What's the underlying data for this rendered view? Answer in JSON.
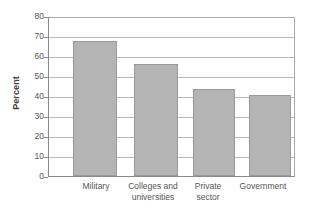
{
  "chart_data": {
    "type": "bar",
    "title": "",
    "subtitle": "",
    "xlabel": "",
    "ylabel": "Percent",
    "categories": [
      "Military",
      "Colleges and universities",
      "Private sector",
      "Government"
    ],
    "values": [
      68.5,
      56.5,
      44,
      41
    ],
    "ylim": [
      0,
      80
    ],
    "ytick_step": 10,
    "yticks": [
      80,
      70,
      60,
      50,
      40,
      30,
      20,
      10,
      0
    ],
    "ytick_labels": [
      "80",
      "70",
      "60",
      "50",
      "40",
      "30",
      "20",
      "10",
      "0"
    ],
    "grid": "horizontal",
    "legend": "none",
    "series": [
      {
        "name": "Percent",
        "values": [
          68.5,
          56.5,
          44,
          41
        ],
        "color": "#b4b4b4"
      }
    ],
    "annotations": []
  },
  "axis": {
    "y_title": "Percent",
    "y_labels": {
      "t80": "80",
      "t70": "70",
      "t60": "60",
      "t50": "50",
      "t40": "40",
      "t30": "30",
      "t20": "20",
      "t10": "10",
      "t0": "0"
    }
  },
  "categories": {
    "c0_line1": "Military",
    "c0_line2": "",
    "c1_line1": "Colleges and",
    "c1_line2": "universities",
    "c2_line1": "Private",
    "c2_line2": "sector",
    "c3_line1": "Government",
    "c3_line2": ""
  },
  "colors": {
    "bar_fill": "#b4b4b4",
    "bar_border": "#9a9a9a",
    "gridline": "#b9b9b9",
    "axis_line": "#8a8a8a",
    "background": "#ffffff",
    "text": "#555555"
  }
}
